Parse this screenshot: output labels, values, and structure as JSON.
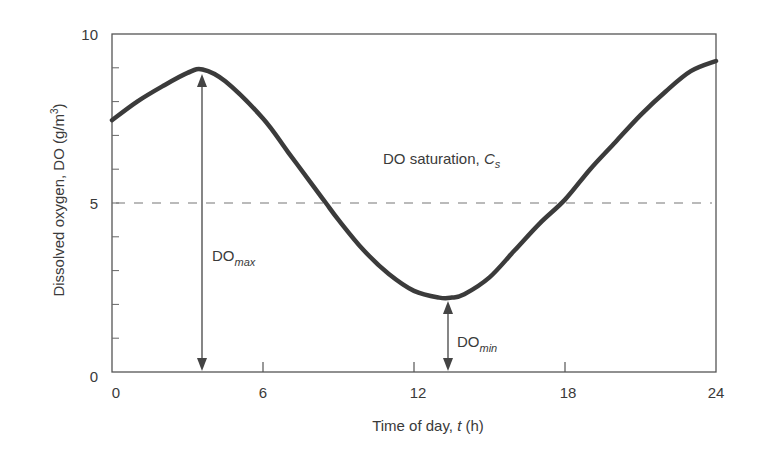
{
  "chart_data": {
    "type": "line",
    "title": "",
    "xlabel": "Time of day, t (h)",
    "ylabel": "Dissolved oxygen, DO (g/m3)",
    "xlim": [
      0,
      24
    ],
    "ylim": [
      0,
      10
    ],
    "x_ticks": [
      0,
      6,
      12,
      18,
      24
    ],
    "y_ticks": [
      0,
      5,
      10
    ],
    "y_minor_ticks": [
      1,
      2,
      3,
      4,
      6,
      7,
      8,
      9
    ],
    "grid": false,
    "series": [
      {
        "name": "Dissolved oxygen",
        "x": [
          0,
          1,
          2,
          3,
          3.6,
          4.5,
          6,
          7,
          8,
          8.5,
          9,
          10,
          11,
          12,
          13,
          13.5,
          14,
          15,
          16,
          17,
          18,
          19,
          20,
          21,
          22,
          23,
          24
        ],
        "y": [
          7.45,
          8.0,
          8.45,
          8.85,
          8.95,
          8.6,
          7.5,
          6.5,
          5.5,
          5.0,
          4.5,
          3.6,
          2.9,
          2.4,
          2.2,
          2.2,
          2.3,
          2.8,
          3.6,
          4.4,
          5.1,
          6.0,
          6.8,
          7.6,
          8.3,
          8.9,
          9.2
        ]
      }
    ],
    "reference_lines": [
      {
        "name": "DO saturation, Cs",
        "y": 5,
        "style": "dashed"
      }
    ],
    "annotations": [
      {
        "text": "DO saturation, Cs",
        "x": 11.2,
        "y": 6.0
      },
      {
        "text": "DOmax",
        "type": "double-arrow",
        "x": 3.6,
        "y_from": 0,
        "y_to": 8.95
      },
      {
        "text": "DOmin",
        "type": "double-arrow",
        "x": 13.3,
        "y_from": 0,
        "y_to": 2.2
      }
    ]
  },
  "labels": {
    "x_axis": "Time of day, ",
    "x_axis_var": "t",
    "x_axis_unit": " (h)",
    "y_axis": "Dissolved oxygen, DO (g/m",
    "y_axis_sup": "3",
    "y_axis_end": ")",
    "saturation": "DO saturation, ",
    "saturation_var": "C",
    "saturation_sub": "s",
    "do_max_main": "DO",
    "do_max_sub": "max",
    "do_min_main": "DO",
    "do_min_sub": "min",
    "x_ticks": [
      "0",
      "6",
      "12",
      "18",
      "24"
    ],
    "y_ticks": [
      "0",
      "5",
      "10"
    ]
  },
  "colors": {
    "curve": "#3b3b3b",
    "axis": "#555555",
    "dashed": "#777777",
    "text": "#3a3a3a"
  }
}
